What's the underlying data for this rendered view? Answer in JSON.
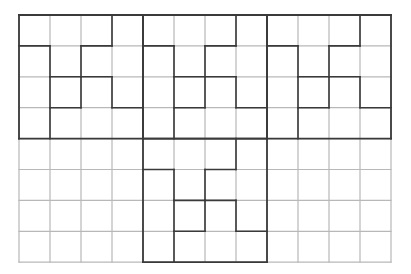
{
  "grid": {
    "cols": 12,
    "rows": 8,
    "origin_x": 19,
    "origin_y": 15,
    "cell_w": 31,
    "cell_h": 30.9,
    "thin_color": "#b8b8b8",
    "thick_color": "#3a3a3a"
  },
  "blocks": [
    {
      "name": "block-top-left",
      "col": 0,
      "row": 0
    },
    {
      "name": "block-top-middle",
      "col": 4,
      "row": 0
    },
    {
      "name": "block-top-right",
      "col": 8,
      "row": 0
    },
    {
      "name": "block-bottom-middle",
      "col": 4,
      "row": 4
    }
  ],
  "block_pattern": {
    "size": 4,
    "vertical": [
      {
        "x": 1,
        "rows": [
          1,
          2,
          3
        ]
      },
      {
        "x": 2,
        "rows": [
          1,
          2
        ]
      },
      {
        "x": 3,
        "rows": [
          0,
          2
        ]
      }
    ],
    "horizontal": [
      {
        "y": 1,
        "cols": [
          0,
          2
        ]
      },
      {
        "y": 2,
        "cols": [
          1,
          2
        ]
      },
      {
        "y": 3,
        "cols": [
          1,
          3
        ]
      }
    ]
  }
}
